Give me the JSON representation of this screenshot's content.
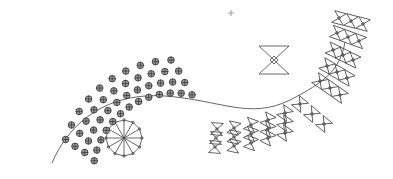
{
  "diagram": {
    "type": "seating-plan",
    "background": "#ffffff",
    "line_color": "#555555",
    "seat_fill": "#9a9a9a"
  },
  "crosshair": {
    "x": 231,
    "y": 13,
    "size": 3
  },
  "curve": {
    "path": "M 52 163 C 70 120, 110 92, 165 96 C 220 100, 250 120, 290 100 C 325 82, 340 70, 345 42"
  },
  "hourglass_symbol": {
    "x": 259,
    "y": 46,
    "w": 30,
    "h": 28
  },
  "round_table": {
    "cx": 124,
    "cy": 138,
    "r": 18,
    "sides": 12
  },
  "circle_seats": {
    "radius": 3.3,
    "rows": [
      {
        "cx": 175,
        "cy": 175,
        "r": 115,
        "a0": 198,
        "a1": 268,
        "n": 10
      },
      {
        "cx": 175,
        "cy": 175,
        "r": 104,
        "a0": 196,
        "a1": 272,
        "n": 11
      },
      {
        "cx": 175,
        "cy": 175,
        "r": 93,
        "a0": 194,
        "a1": 276,
        "n": 12
      },
      {
        "cx": 175,
        "cy": 175,
        "r": 82,
        "a0": 190,
        "a1": 282,
        "n": 13
      }
    ]
  },
  "bowtie_seats": {
    "size": 6,
    "rows": [
      {
        "x0": 339,
        "y0": 18,
        "dx": 12,
        "dy": 3,
        "n": 3,
        "rot": 15
      },
      {
        "x0": 337,
        "y0": 33,
        "dx": 11,
        "dy": 4,
        "n": 3,
        "rot": 20
      },
      {
        "x0": 333,
        "y0": 50,
        "dx": 10,
        "dy": 5,
        "n": 3,
        "rot": 25
      },
      {
        "x0": 327,
        "y0": 66,
        "dx": 10,
        "dy": 6,
        "n": 3,
        "rot": 30
      },
      {
        "x0": 320,
        "y0": 81,
        "dx": 10,
        "dy": 7,
        "n": 3,
        "rot": 35
      },
      {
        "x0": 300,
        "y0": 104,
        "dx": 12,
        "dy": 10,
        "n": 3,
        "rot": 40
      },
      {
        "x0": 285,
        "y0": 113,
        "dx": 0,
        "dy": 10,
        "n": 3,
        "rot": 35
      },
      {
        "x0": 268,
        "y0": 120,
        "dx": 0,
        "dy": 9,
        "n": 3,
        "rot": 28
      },
      {
        "x0": 251,
        "y0": 125,
        "dx": 0,
        "dy": 9,
        "n": 3,
        "rot": 20
      },
      {
        "x0": 234,
        "y0": 128,
        "dx": 0,
        "dy": 9,
        "n": 3,
        "rot": 12
      },
      {
        "x0": 217,
        "y0": 129,
        "dx": -1,
        "dy": 9,
        "n": 3,
        "rot": 5
      }
    ]
  }
}
